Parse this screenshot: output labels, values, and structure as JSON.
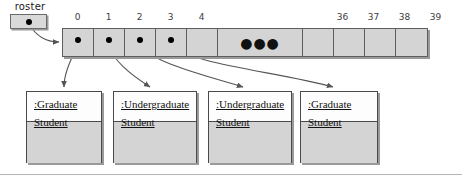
{
  "diagram": {
    "type": "uml-object-array-diagram",
    "pointer_variable": {
      "label": "roster",
      "icon": "filled-dot",
      "points_to": "array[0]"
    },
    "array": {
      "index_labels": [
        "0",
        "1",
        "2",
        "3",
        "4",
        "36",
        "37",
        "38",
        "39"
      ],
      "ellipsis": "●●●",
      "cells": [
        {
          "index": "0",
          "value": "pointer",
          "icon": "filled-dot",
          "points_to": "object-0"
        },
        {
          "index": "1",
          "value": "pointer",
          "icon": "filled-dot",
          "points_to": "object-1"
        },
        {
          "index": "2",
          "value": "pointer",
          "icon": "filled-dot",
          "points_to": "object-2"
        },
        {
          "index": "3",
          "value": "pointer",
          "icon": "filled-dot",
          "points_to": "object-3"
        },
        {
          "index": "4",
          "value": "",
          "icon": "",
          "points_to": ""
        },
        {
          "index": "gap",
          "value": "●●●",
          "icon": "ellipsis-icon",
          "points_to": ""
        },
        {
          "index": "36",
          "value": "",
          "icon": "",
          "points_to": ""
        },
        {
          "index": "37",
          "value": "",
          "icon": "",
          "points_to": ""
        },
        {
          "index": "38",
          "value": "",
          "icon": "",
          "points_to": ""
        },
        {
          "index": "39",
          "value": "",
          "icon": "",
          "points_to": ""
        }
      ]
    },
    "objects": [
      {
        "name_line1": ":Graduate",
        "name_line2": "Student",
        "name": ":Graduate Student"
      },
      {
        "name_line1": ":Undergraduate",
        "name_line2": "Student",
        "name": ":Undergraduate Student"
      },
      {
        "name_line1": ":Undergraduate",
        "name_line2": "Student",
        "name": ":Undergraduate Student"
      },
      {
        "name_line1": ":Graduate",
        "name_line2": "Student",
        "name": ":Graduate Student"
      }
    ],
    "colors": {
      "cell_fill": "#d4d4d4",
      "object_body_fill": "#d4d4d4",
      "object_header_fill": "#fdfdfd",
      "border": "#4a4a4a",
      "shadow": "#9a9a9a",
      "text": "#111111",
      "arrow": "#555555"
    }
  }
}
